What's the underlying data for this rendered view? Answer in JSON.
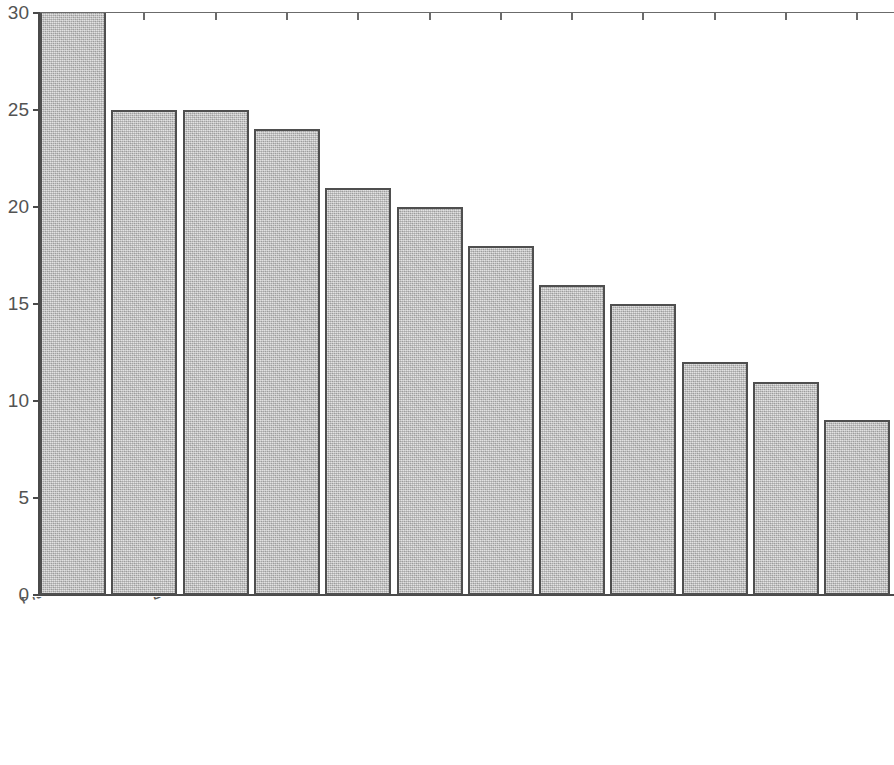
{
  "chart_data": {
    "type": "bar",
    "title": "",
    "subtitle": "",
    "xlabel": "",
    "ylabel": "",
    "categories": [
      "Flakes",
      "Unfilled section",
      "Die shift",
      "Cracking at the flash",
      "Surface cracking",
      "Cold shut",
      "Scale pits",
      "Incomplete forging penetration",
      "grain growth",
      "Incomplete filling of dies",
      "Internal cracks",
      "Residual stress in forging"
    ],
    "values": [
      30,
      25,
      25,
      24,
      21,
      20,
      18,
      16,
      15,
      12,
      11,
      9
    ],
    "ylim": [
      0,
      30
    ],
    "ytick_labels": [
      "0",
      "5",
      "10",
      "15",
      "20",
      "25",
      "30"
    ],
    "ytick_values": [
      0,
      5,
      10,
      15,
      20,
      25,
      30
    ],
    "grid": false,
    "legend": null,
    "legend_position": "none",
    "bar_fill_color": "#bcbcbc",
    "bar_edge_color": "#4f4f4f",
    "axis_color": "#4a4a4a",
    "text_color": "#5a5a5a",
    "background_color": "#ffffff",
    "xlabel_rotation_deg": -20
  }
}
